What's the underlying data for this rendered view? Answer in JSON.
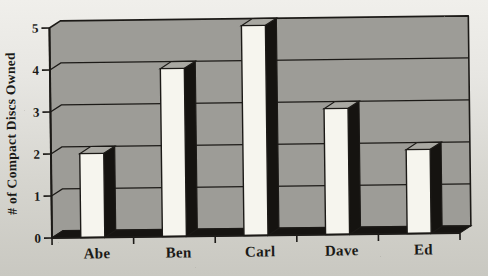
{
  "chart_data": {
    "type": "bar",
    "style": "3d-column-scanned-print",
    "title": "",
    "xlabel": "",
    "ylabel": "# of Compact Discs Owned",
    "categories": [
      "Abe",
      "Ben",
      "Carl",
      "Dave",
      "Ed"
    ],
    "values": [
      2,
      4,
      5,
      3,
      2
    ],
    "ylim": [
      0,
      5
    ],
    "yticks": [
      0,
      1,
      2,
      3,
      4,
      5
    ],
    "grid": "horizontal",
    "legend": "none",
    "colors": {
      "wall": "#9d9c97",
      "line": "#1c1a17",
      "floor": "#161411",
      "bar_front": "#f6f5ee",
      "bar_top": "#a9a8a2",
      "bar_side": "#151310",
      "text": "#1b1a17"
    }
  }
}
